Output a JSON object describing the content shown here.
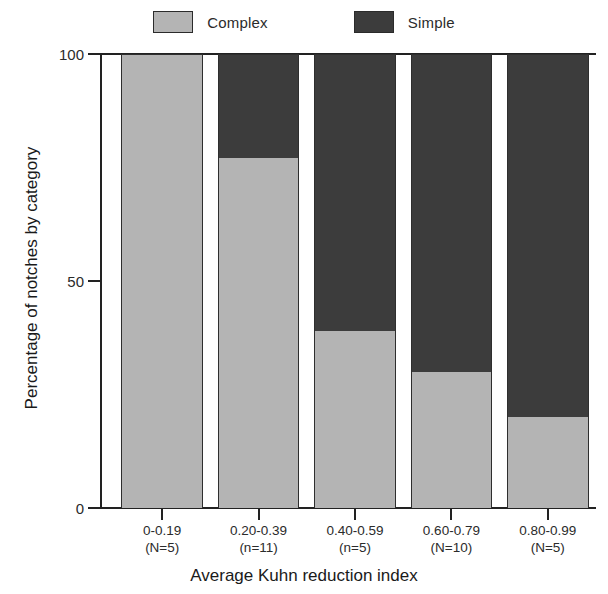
{
  "chart_data": {
    "type": "bar",
    "subtype": "stacked-percentage",
    "title": "",
    "xlabel": "Average Kuhn reduction index",
    "ylabel": "Percentage of notches by category",
    "categories": [
      "0-0.19",
      "0.20-0.39",
      "0.40-0.59",
      "0.60-0.79",
      "0.80-0.99"
    ],
    "category_sublabels": [
      "(N=5)",
      "(n=11)",
      "(n=5)",
      "(N=10)",
      "(N=5)"
    ],
    "series": [
      {
        "name": "Complex",
        "values": [
          100,
          77,
          39,
          30,
          20
        ],
        "color": "#b4b4b4"
      },
      {
        "name": "Simple",
        "values": [
          0,
          23,
          61,
          70,
          80
        ],
        "color": "#3c3c3c"
      }
    ],
    "ylim": [
      0,
      100
    ],
    "yticks": [
      0,
      50,
      100
    ],
    "ytick_labels": [
      "0",
      "50",
      "100"
    ],
    "grid": false,
    "legend_position": "top"
  },
  "legend": {
    "entries": [
      {
        "label": "Complex",
        "color": "#b4b4b4"
      },
      {
        "label": "Simple",
        "color": "#3c3c3c"
      }
    ]
  },
  "axes": {
    "y_title": "Percentage of notches by category",
    "x_title": "Average Kuhn reduction index",
    "y_tick_labels": [
      "100",
      "50",
      "0"
    ]
  }
}
